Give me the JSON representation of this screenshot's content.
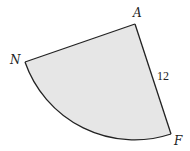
{
  "diagram": {
    "type": "sector",
    "fill_color": "#e6e6e6",
    "stroke_color": "#222222",
    "center": {
      "label": "A",
      "x": 135,
      "y": 24
    },
    "points": [
      {
        "id": "A",
        "label": "A",
        "x": 135,
        "y": 24,
        "label_x": 133,
        "label_y": 17
      },
      {
        "id": "N",
        "label": "N",
        "x": 25,
        "y": 62,
        "label_x": 10,
        "label_y": 64
      },
      {
        "id": "F",
        "label": "F",
        "x": 171,
        "y": 134,
        "label_x": 174,
        "label_y": 145
      }
    ],
    "radius_label": {
      "text": "12",
      "x": 157,
      "y": 80
    },
    "segments": [
      {
        "from": "A",
        "to": "N"
      },
      {
        "from": "A",
        "to": "F"
      }
    ],
    "arc": {
      "from": "N",
      "to": "F",
      "center": "A"
    }
  }
}
